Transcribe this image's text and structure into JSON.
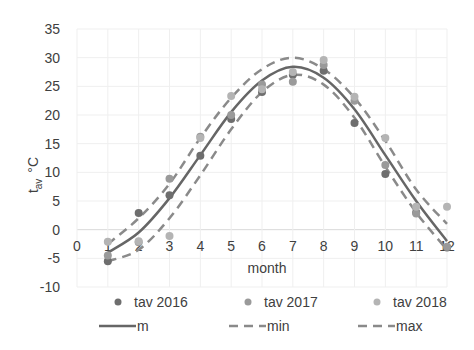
{
  "chart_data": {
    "type": "scatter",
    "title": "",
    "xlabel": "month",
    "ylabel": "t_av °C",
    "ylabel_main": "t",
    "ylabel_sub": "av",
    "ylabel_unit": "°C",
    "xlim": [
      0,
      12
    ],
    "ylim": [
      -10,
      35
    ],
    "x_ticks": [
      0,
      1,
      2,
      3,
      4,
      5,
      6,
      7,
      8,
      9,
      10,
      11,
      12
    ],
    "y_ticks": [
      -10,
      -5,
      0,
      5,
      10,
      15,
      20,
      25,
      30,
      35
    ],
    "grid": true,
    "legend_position": "bottom",
    "series": [
      {
        "name": "tav 2016",
        "kind": "scatter",
        "color": "#6e6e6e",
        "x": [
          1,
          2,
          3,
          4,
          5,
          6,
          7,
          8,
          9,
          10,
          11,
          12
        ],
        "y": [
          -5.5,
          2.9,
          6.0,
          12.9,
          19.3,
          24.0,
          27.0,
          27.7,
          18.6,
          9.7,
          3.0,
          -3.1
        ]
      },
      {
        "name": "tav 2017",
        "kind": "scatter",
        "color": "#9a9a9a",
        "x": [
          1,
          2,
          3,
          4,
          5,
          6,
          7,
          8,
          9,
          10,
          11,
          12
        ],
        "y": [
          -4.5,
          -2.2,
          8.9,
          16.2,
          20.0,
          25.3,
          25.8,
          28.7,
          22.5,
          11.3,
          2.8,
          -3.0
        ]
      },
      {
        "name": "tav 2018",
        "kind": "scatter",
        "color": "#b4b4b4",
        "x": [
          1,
          2,
          3,
          4,
          5,
          6,
          7,
          8,
          9,
          10,
          11,
          12
        ],
        "y": [
          -2.1,
          -2.0,
          -1.1,
          16.0,
          23.3,
          24.5,
          27.5,
          29.6,
          23.2,
          16.0,
          4.0,
          4.0
        ]
      },
      {
        "name": "m",
        "kind": "line",
        "style": "solid",
        "color": "#666666",
        "x": [
          1,
          2,
          3,
          4,
          5,
          6,
          7,
          8,
          9,
          10,
          11,
          12
        ],
        "y": [
          -4.0,
          -0.5,
          5.5,
          13.0,
          20.5,
          26.0,
          28.4,
          26.5,
          21.0,
          13.0,
          5.0,
          -2.0
        ]
      },
      {
        "name": "min",
        "kind": "line",
        "style": "dashed",
        "color": "#8a8a8a",
        "x": [
          1,
          2,
          3,
          4,
          5,
          6,
          7,
          8,
          9,
          10,
          11,
          12
        ],
        "y": [
          -5.5,
          -3.5,
          2.0,
          9.5,
          17.5,
          24.0,
          27.0,
          25.3,
          19.5,
          11.0,
          3.0,
          -3.5
        ]
      },
      {
        "name": "max",
        "kind": "line",
        "style": "dashed",
        "color": "#8a8a8a",
        "x": [
          1,
          2,
          3,
          4,
          5,
          6,
          7,
          8,
          9,
          10,
          11,
          12
        ],
        "y": [
          -2.5,
          2.0,
          8.0,
          16.0,
          23.0,
          28.0,
          30.0,
          28.0,
          23.0,
          15.5,
          7.0,
          1.0
        ]
      }
    ]
  },
  "legend": {
    "items": [
      {
        "label": "tav 2016",
        "kind": "dot",
        "color": "#6e6e6e"
      },
      {
        "label": "tav 2017",
        "kind": "dot",
        "color": "#9a9a9a"
      },
      {
        "label": "tav 2018",
        "kind": "dot",
        "color": "#b4b4b4"
      },
      {
        "label": "m",
        "kind": "solid",
        "color": "#666666"
      },
      {
        "label": "min",
        "kind": "dashed",
        "color": "#8a8a8a"
      },
      {
        "label": "max",
        "kind": "dashed",
        "color": "#8a8a8a"
      }
    ]
  }
}
